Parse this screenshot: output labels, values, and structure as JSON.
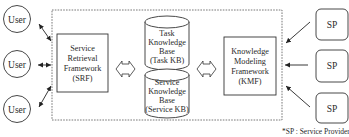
{
  "diagram": {
    "users": [
      "User",
      "User",
      "User"
    ],
    "service_providers": [
      "SP",
      "SP",
      "SP"
    ],
    "srf": {
      "lines": [
        "Service",
        "Retrieval",
        "Framework",
        "(SRF)"
      ]
    },
    "task_kb": {
      "lines": [
        "Task",
        "Knowledge",
        "Base",
        "(Task KB)"
      ]
    },
    "service_kb": {
      "lines": [
        "Service",
        "Knowledge",
        "Base",
        "(Service KB)"
      ]
    },
    "kmf": {
      "lines": [
        "Knowledge",
        "Modeling",
        "Framework",
        "(KMF)"
      ]
    },
    "footnote": "*SP : Service Provider"
  }
}
